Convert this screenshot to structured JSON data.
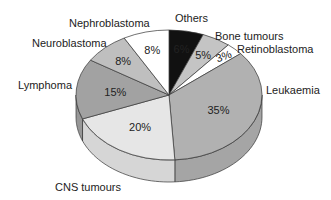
{
  "chart_data": {
    "type": "pie",
    "style": "3d-pie",
    "title": "",
    "categories": [
      "Others",
      "Bone tumours",
      "Retinoblastoma",
      "Leukaemia",
      "CNS tumours",
      "Lymphoma",
      "Neuroblastoma",
      "Nephroblastoma"
    ],
    "values": [
      6,
      5,
      3,
      35,
      20,
      15,
      8,
      8
    ],
    "value_labels": [
      "6%",
      "5%",
      "3%",
      "35%",
      "20%",
      "15%",
      "8%",
      "8%"
    ],
    "colors": [
      "#111111",
      "#c4c4c4",
      "#ffffff",
      "#b1b1b1",
      "#e6e6e6",
      "#a2a2a2",
      "#bfbfbf",
      "#ffffff"
    ],
    "start_angle": "12 o'clock",
    "direction": "clockwise",
    "legend": "none (outside slice labels)"
  },
  "labels": {
    "others": "Others",
    "bone": "Bone tumours",
    "retino": "Retinoblastoma",
    "leuk": "Leukaemia",
    "cns": "CNS tumours",
    "lymph": "Lymphoma",
    "neuro": "Neuroblastoma",
    "nephro": "Nephroblastoma"
  }
}
